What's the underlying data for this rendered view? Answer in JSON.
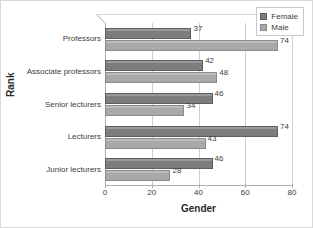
{
  "chart_data": {
    "type": "bar",
    "orientation": "horizontal",
    "title": "",
    "xlabel": "Gender",
    "ylabel": "Rank",
    "xlim": [
      0,
      80
    ],
    "xticks": [
      0,
      20,
      40,
      60,
      80
    ],
    "grid": true,
    "legend_position": "top-right",
    "categories": [
      "Professors",
      "Associate professors",
      "Senior lecturers",
      "Lecturers",
      "Junior lecturers"
    ],
    "series": [
      {
        "name": "Female",
        "color": "#7d7d7d",
        "values": [
          37,
          42,
          46,
          74,
          46
        ]
      },
      {
        "name": "Male",
        "color": "#a9a9a9",
        "values": [
          74,
          48,
          34,
          43,
          28
        ]
      }
    ]
  },
  "legend": {
    "items": [
      {
        "label": "Female"
      },
      {
        "label": "Male"
      }
    ]
  }
}
